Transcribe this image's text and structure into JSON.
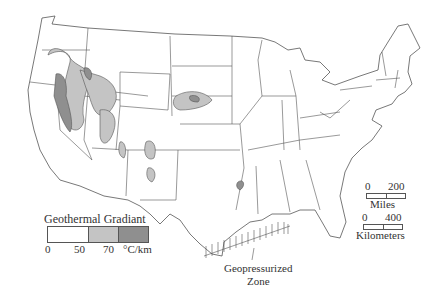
{
  "colors": {
    "low": "#ffffff",
    "mid": "#c4c4c4",
    "high": "#8f8f8f",
    "outline": "#555555"
  },
  "legend": {
    "title": "Geothermal Gradiant",
    "ticks": [
      "0",
      "50",
      "70",
      "°C/km"
    ],
    "classes": [
      {
        "range": "0-50",
        "color": "#ffffff"
      },
      {
        "range": "50-70",
        "color": "#c4c4c4"
      },
      {
        "range": ">70",
        "color": "#8f8f8f"
      }
    ]
  },
  "scale": {
    "miles": {
      "start": "0",
      "end": "200",
      "unit": "Miles"
    },
    "km": {
      "start": "0",
      "end": "400",
      "unit": "Kilometers"
    }
  },
  "annotation": {
    "line1": "Geopressurized",
    "line2": "Zone"
  }
}
